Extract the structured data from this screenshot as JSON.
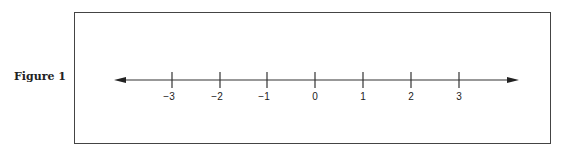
{
  "figure": {
    "label": "Figure 1",
    "number_line": {
      "min": -3,
      "max": 3,
      "arrows": "both",
      "ticks": [
        {
          "value": -3,
          "label": "−3",
          "x": 172
        },
        {
          "value": -2,
          "label": "−2",
          "x": 220
        },
        {
          "value": -1,
          "label": "−1",
          "x": 267
        },
        {
          "value": 0,
          "label": "0",
          "x": 315
        },
        {
          "value": 1,
          "label": "1",
          "x": 363
        },
        {
          "value": 2,
          "label": "2",
          "x": 411
        },
        {
          "value": 3,
          "label": "3",
          "x": 459
        }
      ]
    }
  }
}
